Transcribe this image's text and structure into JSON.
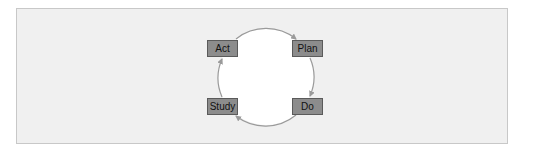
{
  "diagram": {
    "type": "cycle",
    "title": "",
    "colors": {
      "background": "#ffffff",
      "frame_fill": "#f0f0f0",
      "frame_border": "#c8c8c8",
      "circle_fill": "#ffffff",
      "arrow_stroke": "#9a9a9a",
      "box_fill": "#8c8c8c",
      "box_border": "#5a5a5a",
      "text": "#111111"
    },
    "nodes": [
      {
        "id": "act",
        "label": "Act",
        "position": "top-left"
      },
      {
        "id": "plan",
        "label": "Plan",
        "position": "top-right"
      },
      {
        "id": "do",
        "label": "Do",
        "position": "bottom-right"
      },
      {
        "id": "study",
        "label": "Study",
        "position": "bottom-left"
      }
    ],
    "edges": [
      {
        "from": "Act",
        "to": "Plan",
        "direction": "clockwise"
      },
      {
        "from": "Plan",
        "to": "Do",
        "direction": "clockwise"
      },
      {
        "from": "Do",
        "to": "Study",
        "direction": "clockwise"
      },
      {
        "from": "Study",
        "to": "Act",
        "direction": "clockwise"
      }
    ]
  }
}
